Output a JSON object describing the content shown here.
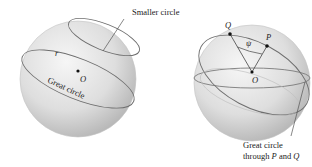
{
  "left_figure": {
    "labels": {
      "smaller_circle": "Smaller circle",
      "radius": "r",
      "center": "O",
      "great_circle": "Great circle"
    }
  },
  "right_figure": {
    "labels": {
      "point_q": "Q",
      "point_p": "P",
      "angle": "ψ",
      "center": "O",
      "caption_line1": "Great circle",
      "caption_line2_prefix": "through ",
      "caption_p": "P",
      "caption_and": " and ",
      "caption_q": "Q"
    }
  },
  "colors": {
    "sphere_light": "#f2f2f2",
    "sphere_dark": "#b8b8b8",
    "circle_stroke": "#6e6e6e",
    "text": "#222222"
  }
}
